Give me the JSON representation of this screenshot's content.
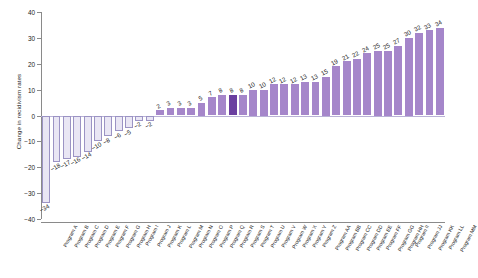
{
  "chart_data": {
    "type": "bar",
    "title": "",
    "xlabel": "",
    "ylabel": "Change in recidivism rates",
    "ylim": [
      -40,
      40
    ],
    "yticks": [
      40,
      30,
      20,
      10,
      0,
      -10,
      -20,
      -30,
      -40
    ],
    "ytick_labels": [
      "40",
      "30",
      "20",
      "10",
      "0",
      "−10",
      "−20",
      "−30",
      "−40"
    ],
    "grid": false,
    "legend": null,
    "orientation": "vertical",
    "sorted": "ascending",
    "categories": [
      "Program A",
      "Program B",
      "Program C",
      "Program D",
      "Program E",
      "Program F",
      "Program G",
      "Program H",
      "Program I",
      "Program J",
      "Program K",
      "Program L",
      "Program M",
      "Program N",
      "Program O",
      "Program P",
      "Program Q",
      "Program R",
      "Program S",
      "Program T",
      "Program U",
      "Program V",
      "Program W",
      "Program X",
      "Program Y",
      "Program Z",
      "Program AA",
      "Program BB",
      "Program CC",
      "Program DD",
      "Program EE",
      "Program FF",
      "Program GG",
      "Program HH",
      "Program II",
      "Program JJ",
      "Program KK",
      "Program LL",
      "Program MM"
    ],
    "values": [
      -34,
      -18,
      -17,
      -16,
      -14,
      -10,
      -8,
      -6,
      -5,
      -2,
      -2,
      2,
      3,
      3,
      3,
      5,
      7,
      8,
      8,
      8,
      10,
      10,
      12,
      12,
      12,
      13,
      13,
      15,
      19,
      21,
      22,
      24,
      25,
      25,
      27,
      30,
      32,
      33,
      34
    ],
    "value_labels": [
      "−34",
      "−18",
      "−17",
      "−16",
      "−14",
      "−10",
      "−8",
      "−6",
      "−5",
      "−2",
      "−2",
      "2",
      "3",
      "3",
      "3",
      "5",
      "7",
      "8",
      "8",
      "8",
      "10",
      "10",
      "12",
      "12",
      "12",
      "13",
      "13",
      "15",
      "19",
      "21",
      "22",
      "24",
      "25",
      "25",
      "27",
      "30",
      "32",
      "33",
      "34"
    ],
    "highlighted_index": 18,
    "colors": {
      "negative_fill": "#e9e6f4",
      "negative_stroke": "#9b93c4",
      "positive_fill": "#a586ca",
      "highlight_fill": "#6b3fa0",
      "axis": "#8a8a8a",
      "zero_line": "#b9b2d6",
      "text": "#1a1a1a"
    }
  }
}
